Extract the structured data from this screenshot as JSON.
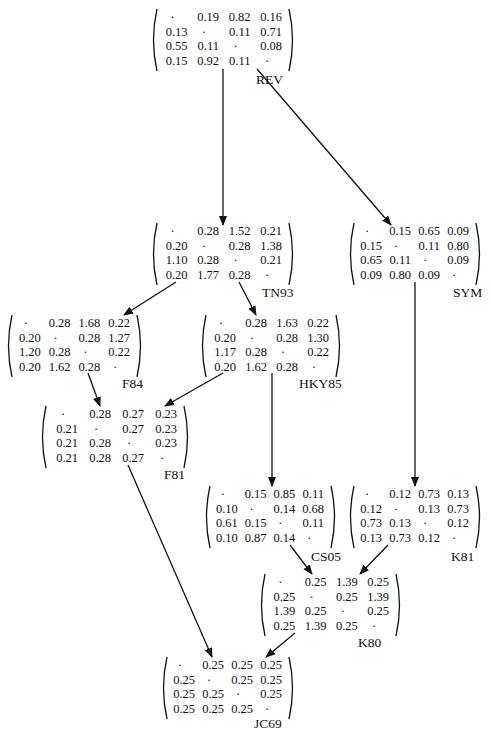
{
  "diagram": {
    "type": "model-hierarchy",
    "nodes": [
      {
        "id": "REV",
        "label": "REV",
        "x": 150,
        "y": 8,
        "w": 146,
        "labelX": 106,
        "labelY": 64,
        "rows": [
          [
            "·",
            "0.19",
            "0.82",
            "0.16"
          ],
          [
            "0.13",
            "·",
            "0.11",
            "0.71"
          ],
          [
            "0.55",
            "0.11",
            "·",
            "0.08"
          ],
          [
            "0.15",
            "0.92",
            "0.11",
            "·"
          ]
        ]
      },
      {
        "id": "TN93",
        "label": "TN93",
        "x": 150,
        "y": 222,
        "w": 146,
        "labelX": 112,
        "labelY": 63,
        "rows": [
          [
            "·",
            "0.28",
            "1.52",
            "0.21"
          ],
          [
            "0.20",
            "·",
            "0.28",
            "1.38"
          ],
          [
            "1.10",
            "0.28",
            "·",
            "0.21"
          ],
          [
            "0.20",
            "1.77",
            "0.28",
            "·"
          ]
        ]
      },
      {
        "id": "SYM",
        "label": "SYM",
        "x": 347,
        "y": 222,
        "w": 136,
        "labelX": 106,
        "labelY": 63,
        "rows": [
          [
            "·",
            "0.15",
            "0.65",
            "0.09"
          ],
          [
            "0.15",
            "·",
            "0.11",
            "0.80"
          ],
          [
            "0.65",
            "0.11",
            "·",
            "0.09"
          ],
          [
            "0.09",
            "0.80",
            "0.09",
            "·"
          ]
        ]
      },
      {
        "id": "F84",
        "label": "F84",
        "x": 5,
        "y": 314,
        "w": 139,
        "labelX": 117,
        "labelY": 62,
        "rows": [
          [
            "·",
            "0.28",
            "1.68",
            "0.22"
          ],
          [
            "0.20",
            "·",
            "0.28",
            "1.27"
          ],
          [
            "1.20",
            "0.28",
            "·",
            "0.22"
          ],
          [
            "0.20",
            "1.62",
            "0.28",
            "·"
          ]
        ]
      },
      {
        "id": "HKY85",
        "label": "HKY85",
        "x": 199,
        "y": 314,
        "w": 144,
        "labelX": 100,
        "labelY": 62,
        "rows": [
          [
            "·",
            "0.28",
            "1.63",
            "0.22"
          ],
          [
            "0.20",
            "·",
            "0.28",
            "1.30"
          ],
          [
            "1.17",
            "0.28",
            "·",
            "0.22"
          ],
          [
            "0.20",
            "1.62",
            "0.28",
            "·"
          ]
        ]
      },
      {
        "id": "F81",
        "label": "F81",
        "x": 39,
        "y": 405,
        "w": 152,
        "labelX": 125,
        "labelY": 62,
        "rows": [
          [
            "·",
            "0.28",
            "0.27",
            "0.23"
          ],
          [
            "0.21",
            "·",
            "0.27",
            "0.23"
          ],
          [
            "0.21",
            "0.28",
            "·",
            "0.23"
          ],
          [
            "0.21",
            "0.28",
            "0.27",
            "·"
          ]
        ]
      },
      {
        "id": "CS05",
        "label": "CS05",
        "x": 203,
        "y": 485,
        "w": 135,
        "labelX": 108,
        "labelY": 64,
        "rows": [
          [
            "·",
            "0.15",
            "0.85",
            "0.11"
          ],
          [
            "0.10",
            "·",
            "0.14",
            "0.68"
          ],
          [
            "0.61",
            "0.15",
            "·",
            "0.11"
          ],
          [
            "0.10",
            "0.87",
            "0.14",
            "·"
          ]
        ]
      },
      {
        "id": "K81",
        "label": "K81",
        "x": 347,
        "y": 485,
        "w": 136,
        "labelX": 104,
        "labelY": 64,
        "rows": [
          [
            "·",
            "0.12",
            "0.73",
            "0.13"
          ],
          [
            "0.12",
            "·",
            "0.13",
            "0.73"
          ],
          [
            "0.73",
            "0.13",
            "·",
            "0.12"
          ],
          [
            "0.13",
            "0.73",
            "0.12",
            "·"
          ]
        ]
      },
      {
        "id": "K80",
        "label": "K80",
        "x": 258,
        "y": 573,
        "w": 145,
        "labelX": 100,
        "labelY": 62,
        "rows": [
          [
            "·",
            "0.25",
            "1.39",
            "0.25"
          ],
          [
            "0.25",
            "·",
            "0.25",
            "1.39"
          ],
          [
            "1.39",
            "0.25",
            "·",
            "0.25"
          ],
          [
            "0.25",
            "1.39",
            "0.25",
            "·"
          ]
        ]
      },
      {
        "id": "JC69",
        "label": "JC69",
        "x": 160,
        "y": 656,
        "w": 136,
        "labelX": 94,
        "labelY": 60,
        "rows": [
          [
            "·",
            "0.25",
            "0.25",
            "0.25"
          ],
          [
            "0.25",
            "·",
            "0.25",
            "0.25"
          ],
          [
            "0.25",
            "0.25",
            "·",
            "0.25"
          ],
          [
            "0.25",
            "0.25",
            "0.25",
            "·"
          ]
        ]
      }
    ],
    "edges": [
      {
        "from": "REV",
        "to": "TN93",
        "x1": 223,
        "y1": 69,
        "x2": 223,
        "y2": 225
      },
      {
        "from": "REV",
        "to": "SYM",
        "x1": 257,
        "y1": 69,
        "x2": 391,
        "y2": 225
      },
      {
        "from": "TN93",
        "to": "F84",
        "x1": 176,
        "y1": 282,
        "x2": 124,
        "y2": 315
      },
      {
        "from": "TN93",
        "to": "HKY85",
        "x1": 239,
        "y1": 282,
        "x2": 256,
        "y2": 315
      },
      {
        "from": "SYM",
        "to": "K81",
        "x1": 415,
        "y1": 282,
        "x2": 415,
        "y2": 486
      },
      {
        "from": "F84",
        "to": "F81",
        "x1": 88,
        "y1": 373,
        "x2": 100,
        "y2": 406
      },
      {
        "from": "HKY85",
        "to": "F81",
        "x1": 223,
        "y1": 373,
        "x2": 165,
        "y2": 406
      },
      {
        "from": "HKY85",
        "to": "CS05",
        "x1": 272,
        "y1": 373,
        "x2": 272,
        "y2": 486
      },
      {
        "from": "F81",
        "to": "JC69",
        "x1": 128,
        "y1": 465,
        "x2": 212,
        "y2": 657
      },
      {
        "from": "CS05",
        "to": "K80",
        "x1": 290,
        "y1": 545,
        "x2": 312,
        "y2": 574
      },
      {
        "from": "K81",
        "to": "K80",
        "x1": 388,
        "y1": 545,
        "x2": 360,
        "y2": 574
      },
      {
        "from": "K80",
        "to": "JC69",
        "x1": 295,
        "y1": 633,
        "x2": 266,
        "y2": 657
      }
    ]
  }
}
